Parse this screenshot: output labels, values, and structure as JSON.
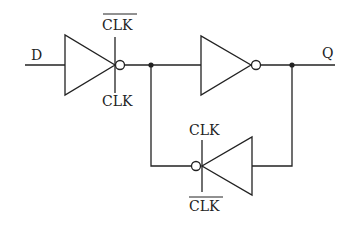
{
  "diagram": {
    "type": "D latch (clocked inverter / tri-state inverter circuit)",
    "labels": {
      "input": "D",
      "output": "Q",
      "inv1_top": "CLK",
      "inv1_top_overline": true,
      "inv1_bottom": "CLK",
      "inv3_top": "CLK",
      "inv3_bottom": "CLK",
      "inv3_bottom_overline": true
    },
    "components": [
      {
        "id": "inv1",
        "kind": "clocked-inverter",
        "direction": "right",
        "control_top": "CLK̄",
        "control_bottom": "CLK"
      },
      {
        "id": "inv2",
        "kind": "inverter",
        "direction": "right"
      },
      {
        "id": "inv3",
        "kind": "clocked-inverter",
        "direction": "left",
        "control_top": "CLK",
        "control_bottom": "CLK̄"
      }
    ],
    "colors": {
      "stroke": "#222222",
      "background": "#ffffff"
    }
  }
}
